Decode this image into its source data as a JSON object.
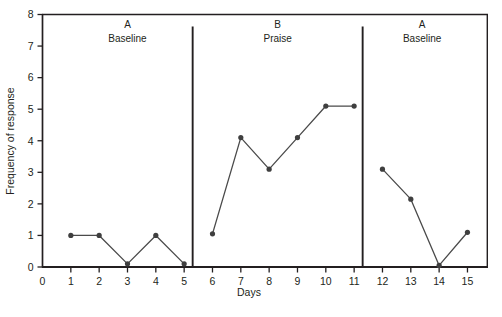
{
  "chart_data": {
    "type": "line",
    "title": "",
    "subtitle": "",
    "xlabel": "Days",
    "ylabel": "Frequency of response",
    "xlim": [
      0,
      15.7
    ],
    "ylim": [
      0,
      8
    ],
    "grid": false,
    "legend": "none",
    "x_ticks": [
      "0",
      "1",
      "2",
      "3",
      "4",
      "5",
      "6",
      "7",
      "8",
      "9",
      "10",
      "11",
      "12",
      "13",
      "14",
      "15"
    ],
    "y_ticks": [
      "0",
      "1",
      "2",
      "3",
      "4",
      "5",
      "6",
      "7",
      "8"
    ],
    "x": [
      1,
      2,
      3,
      4,
      5,
      6,
      7,
      8,
      9,
      10,
      11,
      12,
      13,
      14,
      15
    ],
    "values": [
      1.0,
      1.0,
      0.1,
      1.0,
      0.1,
      1.05,
      4.1,
      3.1,
      4.1,
      5.1,
      5.1,
      3.1,
      2.15,
      0.05,
      1.1
    ],
    "series": [
      {
        "name": "Frequency of response",
        "x": [
          1,
          2,
          3,
          4,
          5,
          6,
          7,
          8,
          9,
          10,
          11,
          12,
          13,
          14,
          15
        ],
        "values": [
          1.0,
          1.0,
          0.1,
          1.0,
          0.1,
          1.05,
          4.1,
          3.1,
          4.1,
          5.1,
          5.1,
          3.1,
          2.15,
          0.05,
          1.1
        ]
      }
    ],
    "segments": [
      {
        "x": [
          1,
          2,
          3,
          4,
          5
        ],
        "values": [
          1.0,
          1.0,
          0.1,
          1.0,
          0.1
        ]
      },
      {
        "x": [
          6,
          7,
          8,
          9,
          10,
          11
        ],
        "values": [
          1.05,
          4.1,
          3.1,
          4.1,
          5.1,
          5.1
        ]
      },
      {
        "x": [
          12,
          13,
          14,
          15
        ],
        "values": [
          3.1,
          2.15,
          0.05,
          1.1
        ]
      }
    ],
    "phase_dividers": [
      5.3,
      11.3
    ],
    "phases": [
      {
        "letter": "A",
        "name": "Baseline",
        "center_x": 3.0
      },
      {
        "letter": "B",
        "name": "Praise",
        "center_x": 8.3
      },
      {
        "letter": "A",
        "name": "Baseline",
        "center_x": 13.4
      }
    ],
    "colors": {
      "line": "#4a4a4a",
      "marker": "#3f3f3f",
      "axis": "#231f20",
      "divider": "#231f20",
      "background": "#ffffff"
    }
  }
}
